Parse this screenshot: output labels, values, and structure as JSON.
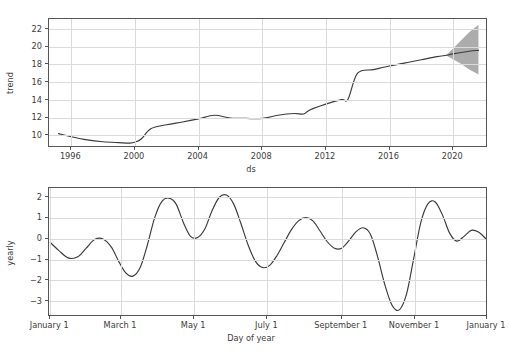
{
  "figure": {
    "background": "#ffffff",
    "line_color": "#3b3b3b",
    "grid_color": "#d9d9de",
    "uncertainty_color": "#9a9a9a",
    "footer_ghost_text": "                                       "
  },
  "chart_data": [
    {
      "type": "line",
      "panel": "trend",
      "title": "",
      "xlabel": "ds",
      "ylabel": "trend",
      "grid": true,
      "legend": "none",
      "xlim": [
        1994.6,
        2022.2
      ],
      "ylim": [
        8.6,
        23.0
      ],
      "xticks": [
        1996,
        2000,
        2004,
        2008,
        2012,
        2016,
        2020
      ],
      "xticklabels": [
        "1996",
        "2000",
        "2004",
        "2008",
        "2012",
        "2016",
        "2020"
      ],
      "yticks": [
        10,
        12,
        14,
        16,
        18,
        20,
        22
      ],
      "yticklabels": [
        "10",
        "12",
        "14",
        "16",
        "18",
        "20",
        "22"
      ],
      "series": [
        {
          "name": "trend",
          "x": [
            1995.2,
            1996.0,
            1997.0,
            1998.0,
            1999.0,
            1999.7,
            2000.0,
            2000.4,
            2001.0,
            2002.0,
            2003.0,
            2004.0,
            2005.0,
            2006.0,
            2007.0,
            2008.0,
            2009.0,
            2010.0,
            2010.6,
            2011.0,
            2012.0,
            2013.0,
            2013.4,
            2014.0,
            2015.0,
            2016.0,
            2017.0,
            2018.0,
            2019.0,
            2019.6,
            2020.0,
            2021.0,
            2021.6
          ],
          "y": [
            10.2,
            9.85,
            9.5,
            9.3,
            9.2,
            9.15,
            9.25,
            9.6,
            10.75,
            11.2,
            11.5,
            11.85,
            12.25,
            11.95,
            11.9,
            11.9,
            12.25,
            12.45,
            12.4,
            12.85,
            13.5,
            14.0,
            14.05,
            16.95,
            17.35,
            17.75,
            18.1,
            18.45,
            18.8,
            18.95,
            19.1,
            19.4,
            19.5
          ]
        }
      ],
      "uncertainty": {
        "name": "forecast uncertainty interval",
        "x": [
          2019.6,
          2020.0,
          2020.5,
          2021.0,
          2021.6
        ],
        "lower": [
          18.9,
          18.5,
          18.0,
          17.4,
          16.8
        ],
        "upper": [
          19.0,
          19.7,
          20.6,
          21.5,
          22.35
        ]
      }
    },
    {
      "type": "line",
      "panel": "yearly",
      "title": "",
      "xlabel": "Day of year",
      "ylabel": "yearly",
      "grid": true,
      "legend": "none",
      "xlim": [
        0,
        366
      ],
      "ylim": [
        -3.65,
        2.35
      ],
      "xticks": [
        1,
        60,
        121,
        182,
        244,
        305,
        366
      ],
      "xticklabels": [
        "January 1",
        "March 1",
        "May 1",
        "July 1",
        "September 1",
        "November 1",
        "January 1"
      ],
      "yticks": [
        -3,
        -2,
        -1,
        0,
        1,
        2
      ],
      "yticklabels": [
        "−3",
        "−2",
        "−1",
        "0",
        "1",
        "2"
      ],
      "series": [
        {
          "name": "yearly",
          "x": [
            1,
            8,
            16,
            24,
            31,
            38,
            45,
            52,
            58,
            64,
            70,
            76,
            82,
            88,
            94,
            100,
            106,
            112,
            118,
            124,
            130,
            136,
            142,
            148,
            154,
            160,
            166,
            172,
            178,
            184,
            190,
            196,
            202,
            208,
            214,
            220,
            226,
            232,
            238,
            244,
            250,
            256,
            262,
            268,
            274,
            280,
            286,
            292,
            298,
            304,
            310,
            316,
            322,
            328,
            334,
            340,
            346,
            352,
            358,
            365
          ],
          "y": [
            -0.18,
            -0.55,
            -0.9,
            -0.85,
            -0.45,
            -0.05,
            -0.02,
            -0.4,
            -1.05,
            -1.6,
            -1.75,
            -1.35,
            -0.3,
            0.95,
            1.72,
            1.88,
            1.6,
            0.75,
            0.1,
            0.05,
            0.45,
            1.3,
            1.92,
            2.02,
            1.6,
            0.7,
            -0.3,
            -1.05,
            -1.35,
            -1.25,
            -0.8,
            -0.2,
            0.4,
            0.82,
            0.97,
            0.82,
            0.35,
            -0.15,
            -0.45,
            -0.45,
            -0.1,
            0.32,
            0.5,
            0.2,
            -0.85,
            -2.15,
            -3.1,
            -3.32,
            -2.6,
            -0.95,
            0.75,
            1.62,
            1.7,
            1.1,
            0.25,
            -0.12,
            0.1,
            0.38,
            0.3,
            -0.05
          ]
        }
      ]
    }
  ]
}
